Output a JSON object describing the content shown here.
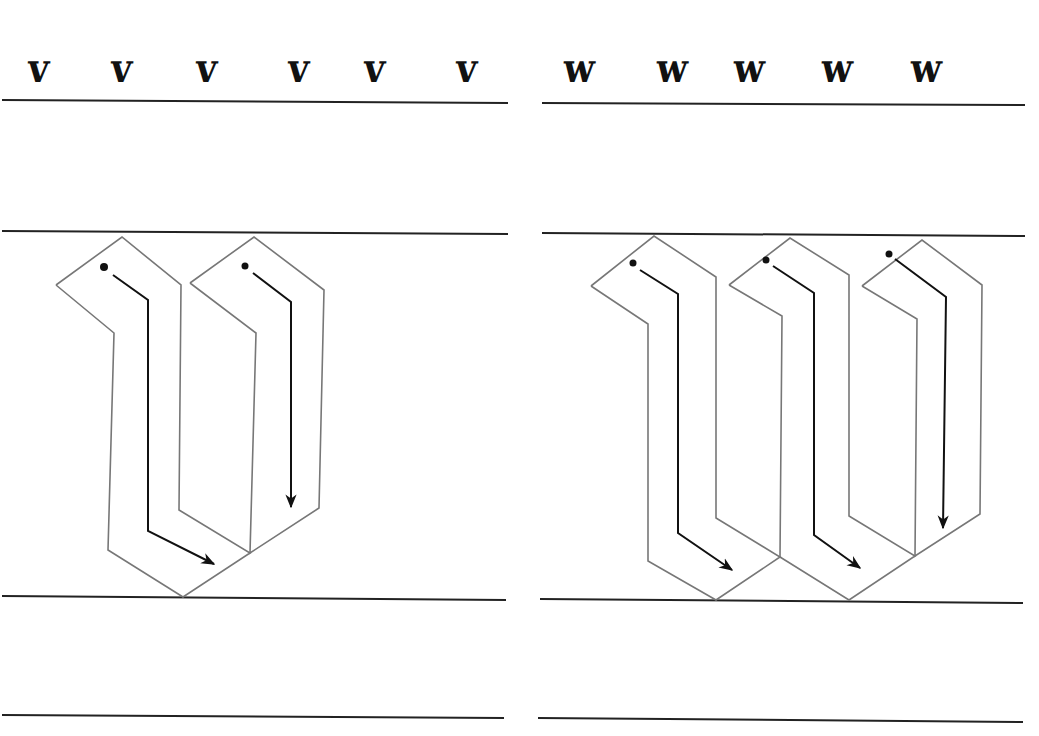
{
  "worksheet": {
    "panels": [
      {
        "id": "v",
        "letter": "v",
        "exemplars": [
          "v",
          "v",
          "v",
          "v",
          "v",
          "v"
        ],
        "exemplar_x": [
          27,
          110,
          195,
          287,
          363,
          455
        ],
        "strokes": 2
      },
      {
        "id": "w",
        "letter": "w",
        "exemplars": [
          "w",
          "w",
          "w",
          "w",
          "w"
        ],
        "exemplar_x": [
          42,
          135,
          212,
          300,
          389
        ],
        "strokes": 3
      }
    ],
    "colors": {
      "ruling": "#222222",
      "outline": "#777777",
      "stroke_path": "#111111"
    }
  }
}
